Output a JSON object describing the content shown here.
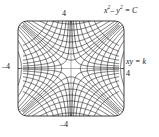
{
  "figure": {
    "title": "",
    "box": {
      "left": 18,
      "top": 21,
      "right": 124,
      "bottom": 116,
      "corner_radius": 9
    }
  },
  "labels": {
    "top_tick": "4",
    "bottom_tick": "–4",
    "left_tick": "–4",
    "right_tick": "4",
    "curve_family_c_prefix": "x",
    "curve_family_c": "– y",
    "curve_family_c_suffix": "= C",
    "curve_family_k": "xy = k"
  },
  "colors": {
    "curve": "#1a1a1a",
    "axis": "#9a9a9a",
    "frame": "#2a2a2a",
    "background": "#ffffff"
  },
  "chart_data": {
    "type": "line",
    "xlabel": "",
    "ylabel": "",
    "xlim": [
      -4,
      4
    ],
    "ylim": [
      -4,
      4
    ],
    "grid": false,
    "legend": "none",
    "xticks": [
      -4,
      4
    ],
    "yticks": [
      -4,
      4
    ],
    "xticklabels": [
      "–4",
      "4"
    ],
    "yticklabels": [
      "–4",
      "4"
    ],
    "annotations": [
      {
        "text": "x² – y² = C",
        "x": 4.2,
        "y": 4.6
      },
      {
        "text": "xy = k",
        "x": 4.3,
        "y": 0.5
      }
    ],
    "series": [
      {
        "name": "x^2 - y^2 = C",
        "equation": "x^2 - y^2 = C",
        "style": "solid",
        "color": "#1a1a1a",
        "parameter": "C",
        "parameter_values": [
          -14,
          -10.5,
          -7.5,
          -5,
          -3,
          -1.5,
          -0.5,
          0.5,
          1.5,
          3,
          5,
          7.5,
          10.5,
          14
        ]
      },
      {
        "name": "xy = k",
        "equation": "xy = k",
        "style": "solid",
        "color": "#1a1a1a",
        "parameter": "k",
        "parameter_values": [
          -7,
          -5.25,
          -3.75,
          -2.5,
          -1.5,
          -0.75,
          -0.25,
          0.25,
          0.75,
          1.5,
          2.5,
          3.75,
          5.25,
          7
        ]
      }
    ]
  }
}
